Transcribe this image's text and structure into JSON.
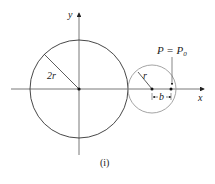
{
  "figure": {
    "caption": "(i)",
    "axes": {
      "x_label": "x",
      "y_label": "y"
    },
    "large_circle": {
      "radius_label": "2r",
      "color": "#333333"
    },
    "small_circle": {
      "radius_label": "r",
      "color": "#9a9a9a"
    },
    "point_label": "P = P",
    "point_subscript": "0",
    "distance_label": "b"
  }
}
